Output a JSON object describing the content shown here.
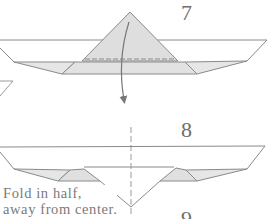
{
  "diagram": {
    "type": "origami-instructions",
    "steps": [
      {
        "number": "7",
        "description": "Paper boat with triangular sail; valley fold down along dashed line"
      },
      {
        "number": "8",
        "description": "Boat with center line, sail folded down"
      },
      {
        "number": "9",
        "description": "Partially visible next step number"
      }
    ],
    "caption_line1": "Fold in half,",
    "caption_line2": "away from center.",
    "colors": {
      "line": "#8a8a8a",
      "fill": "#e2e2e2",
      "text": "#6e6e6e",
      "background": "#ffffff"
    }
  }
}
